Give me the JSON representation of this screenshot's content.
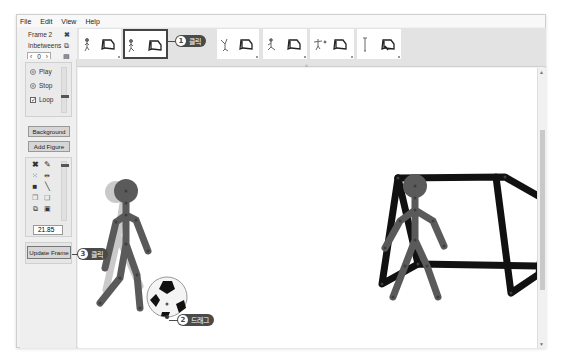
{
  "menu": {
    "items": [
      "File",
      "Edit",
      "View",
      "Help"
    ]
  },
  "frame_info": {
    "frame_label": "Frame 2",
    "inbetweens_label": "Inbetweens",
    "inbetweens_value": "0",
    "dec": "‹",
    "inc": "›",
    "icons": [
      "delete-frame-icon",
      "copy-frame-icon",
      "paste-frame-icon"
    ]
  },
  "timeline": {
    "frames": [
      {
        "index": 1,
        "selected": false
      },
      {
        "index": 2,
        "selected": true
      },
      {
        "index": 3,
        "selected": false
      },
      {
        "index": 4,
        "selected": false
      },
      {
        "index": 5,
        "selected": false
      },
      {
        "index": 6,
        "selected": false
      }
    ],
    "collapse_glyph": "˅"
  },
  "playback": {
    "play_label": "Play",
    "stop_label": "Stop",
    "loop_label": "Loop",
    "loop_checked": true,
    "loop_check_glyph": "✓"
  },
  "buttons": {
    "background_label": "Background",
    "add_figure_label": "Add Figure",
    "update_frame_label": "Update Frame"
  },
  "tools": {
    "icons": [
      "delete-icon",
      "pencil-icon",
      "center-icon",
      "flip-icon",
      "color-square-icon",
      "line-tool-icon",
      "copy-figure-icon",
      "paste-figure-icon",
      "front-icon",
      "back-icon"
    ],
    "scale_value": "21.85"
  },
  "callouts": [
    {
      "num": "1",
      "text": "클릭"
    },
    {
      "num": "2",
      "text": "드래그"
    },
    {
      "num": "3",
      "text": "클릭"
    }
  ],
  "scrollbar": {
    "up": "▲",
    "down": "▼"
  },
  "colors": {
    "figure": "#5a5a5a",
    "ghost": "#c2c2c2",
    "goal": "#111111",
    "callout_bg": "#4a4a4a"
  }
}
